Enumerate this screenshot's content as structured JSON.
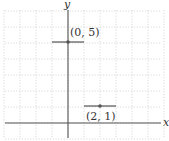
{
  "diagram": {
    "type": "coordinate-grid",
    "axes": {
      "x_label": "x",
      "y_label": "y"
    },
    "grid": {
      "x_range": [
        -4,
        6
      ],
      "y_range": [
        -1,
        7
      ],
      "unit_px": 16
    },
    "points": [
      {
        "x": 0,
        "y": 5,
        "label": "(0, 5)",
        "segment": [
          -1,
          1
        ]
      },
      {
        "x": 2,
        "y": 1,
        "label": "(2, 1)",
        "segment": [
          1,
          3
        ]
      }
    ],
    "colors": {
      "axis": "#555555",
      "grid": "#c8c8c8",
      "point": "#555555",
      "segment": "#444444"
    }
  }
}
